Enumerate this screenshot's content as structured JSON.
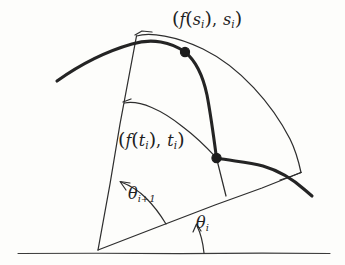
{
  "figure": {
    "background_color": "#fdfdfb",
    "ink_color": "#242424",
    "labels": {
      "s_point": {
        "open_paren": "(",
        "function": "f",
        "inner_open": "(",
        "inner_var": "s",
        "inner_sub": "i",
        "inner_close": ")",
        "comma": ",",
        "second_var": "s",
        "second_sub": "i",
        "close_paren": ")",
        "plain": "(f(si), si)"
      },
      "t_point": {
        "open_paren": "(",
        "function": "f",
        "inner_open": "(",
        "inner_var": "t",
        "inner_sub": "i",
        "inner_close": ")",
        "comma": ",",
        "second_var": "t",
        "second_sub": "i",
        "close_paren": ")",
        "plain": "(f(ti), ti)"
      },
      "theta_next": {
        "symbol": "θ",
        "subscript": "i+1",
        "plain": "θi+1"
      },
      "theta_i": {
        "symbol": "θ",
        "subscript": "i",
        "plain": "θi"
      }
    },
    "geometry": {
      "apex": {
        "x": 98,
        "y": 250
      },
      "baseline": {
        "x1": 18,
        "y1": 253,
        "x2": 330,
        "y2": 253
      },
      "ray_theta_next": {
        "x1": 98,
        "y1": 250,
        "x2": 137,
        "y2": 36
      },
      "ray_theta_i": {
        "x1": 98,
        "y1": 250,
        "x2": 301,
        "y2": 172
      },
      "outer_arc": {
        "start_x": 137,
        "start_y": 36,
        "end_x": 301,
        "end_y": 172
      },
      "inner_arc": {
        "start_x": 125,
        "start_y": 103,
        "end_x": 216,
        "end_y": 158
      },
      "thick_curve_start": {
        "x": 57,
        "y": 81
      },
      "thick_curve_end": {
        "x": 312,
        "y": 196
      },
      "point_s": {
        "x": 185,
        "y": 52
      },
      "point_t": {
        "x": 216,
        "y": 158
      },
      "angle_arc_theta_next": {
        "radius": 72
      },
      "angle_arc_theta_i": {
        "radius": 106
      }
    }
  }
}
